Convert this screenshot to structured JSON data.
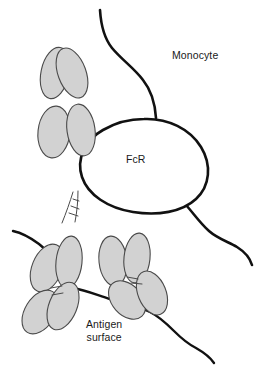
{
  "figure": {
    "type": "biological-schematic",
    "background_color": "#ffffff"
  },
  "labels": {
    "monocyte": "Monocyte",
    "receptor": "FcR",
    "antigen_surface": "Antigen\nsurface"
  },
  "colors": {
    "ig_domain_fill": "#d2d2d2",
    "ig_domain_stroke": "#4a4a4a",
    "membrane_stroke": "#111111",
    "receptor_fill": "#ffffff",
    "text": "#1a1a1a"
  },
  "elements": {
    "monocyte_membrane": "upper-and-right cell boundary curve",
    "fc_receptor": "large white oval labelled FcR",
    "antigen_surface_line": "wavy line crossing lower portion of figure",
    "antibodies": [
      {
        "id": "antibody-upper",
        "position": "upper-left",
        "domain_count": 4,
        "role": "bound to FcR via Fc region"
      },
      {
        "id": "antibody-lower-left",
        "position": "lower-left",
        "domain_count": 4,
        "role": "bound to antigen surface"
      },
      {
        "id": "antibody-lower-right",
        "position": "lower-center-right",
        "domain_count": 4,
        "role": "bound to antigen surface"
      }
    ],
    "hinge_regions": 2
  }
}
